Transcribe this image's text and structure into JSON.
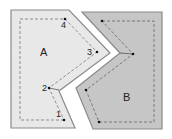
{
  "diagram": {
    "regions": [
      {
        "id": "A",
        "label": "A",
        "fill": "#e8e8e8",
        "stroke": "#8a8a8a",
        "points": "11,10 69,10 110,53 59,91 75,128 11,128",
        "path": "20,19 65,19 97,52 49,88 64,120 20,120"
      },
      {
        "id": "B",
        "label": "B",
        "fill": "#c6c6c6",
        "stroke": "#8a8a8a",
        "points": "82,12 162,12 162,129 93,129 76,88 120,53",
        "path": "102,21 154,21 154,122 99,122 86,90 133,54"
      }
    ],
    "point_labels": [
      {
        "label": "1",
        "x": 56,
        "y": 110
      },
      {
        "label": "2",
        "x": 42,
        "y": 84
      },
      {
        "label": "3",
        "x": 87,
        "y": 48
      },
      {
        "label": "4",
        "x": 61,
        "y": 21
      }
    ],
    "region_labels": [
      {
        "label": "A",
        "x": 40,
        "y": 47
      },
      {
        "label": "B",
        "x": 123,
        "y": 92
      }
    ]
  }
}
